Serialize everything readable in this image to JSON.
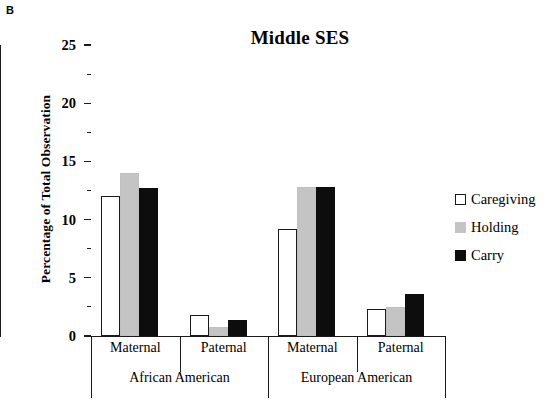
{
  "panel": {
    "label": "B"
  },
  "chart_data": {
    "type": "bar",
    "title": "Middle SES",
    "xlabel": "",
    "ylabel": "Percentage of Total Observation",
    "ylim": [
      0,
      25
    ],
    "ytick_labels": [
      "0",
      "5",
      "10",
      "15",
      "20",
      "25"
    ],
    "ytick_values": [
      0,
      5,
      10,
      15,
      20,
      25
    ],
    "yminor_values": [
      2.5,
      7.5,
      12.5,
      17.5,
      22.5
    ],
    "grid": false,
    "legend_position": "right",
    "group_labels": [
      "African American",
      "European American"
    ],
    "categories": [
      "Maternal",
      "Paternal",
      "Maternal",
      "Paternal"
    ],
    "series": [
      {
        "name": "Caregiving",
        "color": "#ffffff",
        "edge_color": "#1a1a1a",
        "values": [
          12.0,
          1.8,
          9.2,
          2.3
        ]
      },
      {
        "name": "Holding",
        "color": "#c4c4c4",
        "edge_color": "#c4c4c4",
        "values": [
          14.0,
          0.8,
          12.8,
          2.5
        ]
      },
      {
        "name": "Carry",
        "color": "#0d0d0d",
        "edge_color": "#0d0d0d",
        "values": [
          12.7,
          1.4,
          12.8,
          3.6
        ]
      }
    ]
  }
}
